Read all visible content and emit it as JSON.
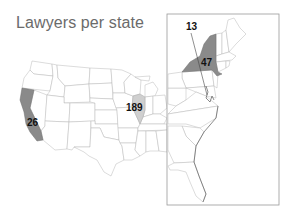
{
  "title": "Lawyers per state",
  "colors": {
    "dark_fill": "#8a8a8a",
    "light_fill": "#cfcfcf",
    "border": "#b8b8b8",
    "inset_frame": "#9a9a9a",
    "title": "#6b6b6b"
  },
  "inset": {
    "label": "Northeast / East Coast inset"
  },
  "callouts": [
    {
      "state": "California",
      "value": "26",
      "shade": "dark"
    },
    {
      "state": "Illinois",
      "value": "189",
      "shade": "light"
    },
    {
      "state": "New York",
      "value": "47",
      "shade": "dark"
    },
    {
      "state": "Delaware / Maryland",
      "value": "13",
      "shade": "none",
      "leader_line": true
    }
  ]
}
